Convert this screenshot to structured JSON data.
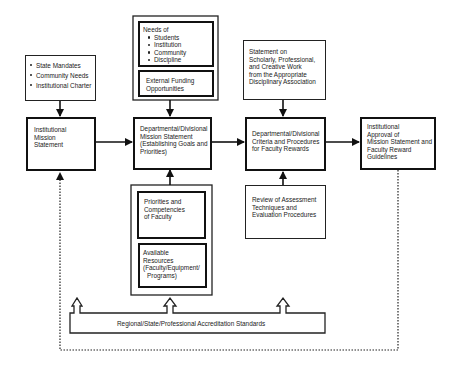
{
  "diagram": {
    "inputs_box": {
      "items": [
        "State Mandates",
        "Community Needs",
        "Institutional Charter"
      ]
    },
    "institutional_mission": {
      "lines": [
        "Institutional",
        "Mission",
        "Statement"
      ]
    },
    "needs_box": {
      "heading": "Needs of",
      "items": [
        "Students",
        "Institution",
        "Community",
        "Discipline"
      ]
    },
    "external_funding": {
      "lines": [
        "External Funding",
        "Opportunities"
      ]
    },
    "dept_mission": {
      "lines": [
        "Departmental/Divisional",
        "Mission Statement",
        "(Establishing Goals and",
        "Priorities)"
      ]
    },
    "priorities_box": {
      "lines": [
        "Priorities and",
        "Competencies",
        "of Faculty"
      ]
    },
    "resources_box": {
      "lines": [
        "Available",
        "Resources",
        "(Faculty/Equipment/",
        "Programs)"
      ]
    },
    "scholarly_statement": {
      "lines": [
        "Statement on",
        "Scholarly, Professional,",
        "and Creative Work",
        "from the Appropriate",
        "Disciplinary Association"
      ]
    },
    "dept_criteria": {
      "lines": [
        "Departmental/Divisional",
        "Criteria and Procedures",
        "for Faculty Rewards"
      ]
    },
    "review_box": {
      "lines": [
        "Review of Assessment",
        "Techniques and",
        "Evaluation Procedures"
      ]
    },
    "institutional_approval": {
      "lines": [
        "Institutional",
        "Approval of",
        "Mission Statement and",
        "Faculty Reward",
        "Guidelines"
      ]
    },
    "accreditation": {
      "label": "Regional/State/Professional Accreditation Standards"
    },
    "colors": {
      "stroke": "#111111",
      "background": "#ffffff"
    }
  }
}
